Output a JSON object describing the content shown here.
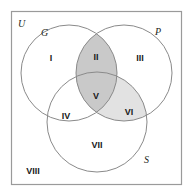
{
  "diagram": {
    "type": "venn-3-set",
    "universal_set": {
      "label": "U",
      "name": "universal-set"
    },
    "sets": [
      {
        "id": "G",
        "label": "G",
        "label_x": 41,
        "label_y": 36,
        "cx": 69,
        "cy": 73,
        "r": 48
      },
      {
        "id": "P",
        "label": "P",
        "label_x": 155,
        "label_y": 35,
        "cx": 124,
        "cy": 73,
        "r": 48
      },
      {
        "id": "S",
        "label": "S",
        "label_x": 144,
        "label_y": 163,
        "cx": 97,
        "cy": 122,
        "r": 50
      }
    ],
    "frame": {
      "x": 11,
      "y": 11,
      "width": 171,
      "height": 174
    },
    "regions": [
      {
        "id": "I",
        "label": "I",
        "x": 51,
        "y": 59,
        "sets": "G only",
        "shade": "none"
      },
      {
        "id": "II",
        "label": "II",
        "x": 96,
        "y": 58,
        "sets": "G and P",
        "shade": "dark"
      },
      {
        "id": "III",
        "label": "III",
        "x": 140,
        "y": 59,
        "sets": "P only",
        "shade": "none"
      },
      {
        "id": "IV",
        "label": "IV",
        "x": 66,
        "y": 117,
        "sets": "G and S",
        "shade": "none"
      },
      {
        "id": "V",
        "label": "V",
        "x": 96,
        "y": 97,
        "sets": "G, P and S",
        "shade": "dark"
      },
      {
        "id": "VI",
        "label": "VI",
        "x": 129,
        "y": 113,
        "sets": "P and S",
        "shade": "light"
      },
      {
        "id": "VII",
        "label": "VII",
        "x": 97,
        "y": 146,
        "sets": "S only",
        "shade": "none"
      },
      {
        "id": "VIII",
        "label": "VIII",
        "x": 33,
        "y": 172,
        "sets": "outside all",
        "shade": "none"
      }
    ],
    "colors": {
      "shade_dark": "#c9c9c9",
      "shade_light": "#e2e2e2",
      "circle_stroke": "#8a8a8a",
      "frame_stroke": "#9a9a9a",
      "background": "#ffffff",
      "text": "#1a1a1a"
    },
    "u_label_pos": {
      "x": 18,
      "y": 27
    }
  }
}
